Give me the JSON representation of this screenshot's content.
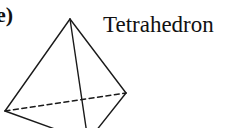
{
  "figure": {
    "panel_label": "e)",
    "title": "Tetrahedron",
    "shape": "tetrahedron",
    "stroke_color": "#1a1a1a",
    "vertices": {
      "apex": [
        70,
        19
      ],
      "left": [
        5,
        111
      ],
      "right": [
        126,
        93
      ],
      "front_bottom": [
        92,
        141
      ]
    },
    "edges": {
      "solid": [
        [
          "apex",
          "left"
        ],
        [
          "apex",
          "right"
        ],
        [
          "apex",
          "front_bottom"
        ],
        [
          "left",
          "front_bottom"
        ],
        [
          "right",
          "front_bottom"
        ]
      ],
      "dashed": [
        [
          "left",
          "right"
        ]
      ]
    }
  }
}
